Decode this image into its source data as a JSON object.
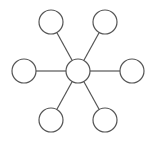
{
  "diagram": {
    "type": "star-network",
    "width": 150,
    "height": 145,
    "stroke_color": "#555555",
    "fill_color": "#ffffff",
    "stroke_width": 1.2,
    "node_radius": 12,
    "hub": {
      "id": "hub",
      "cx": 78,
      "cy": 71
    },
    "nodes": [
      {
        "id": "top-left",
        "cx": 51,
        "cy": 22
      },
      {
        "id": "top-right",
        "cx": 105,
        "cy": 22
      },
      {
        "id": "left",
        "cx": 24,
        "cy": 71
      },
      {
        "id": "right",
        "cx": 132,
        "cy": 71
      },
      {
        "id": "bottom-left",
        "cx": 51,
        "cy": 120
      },
      {
        "id": "bottom-right",
        "cx": 105,
        "cy": 120
      }
    ]
  }
}
